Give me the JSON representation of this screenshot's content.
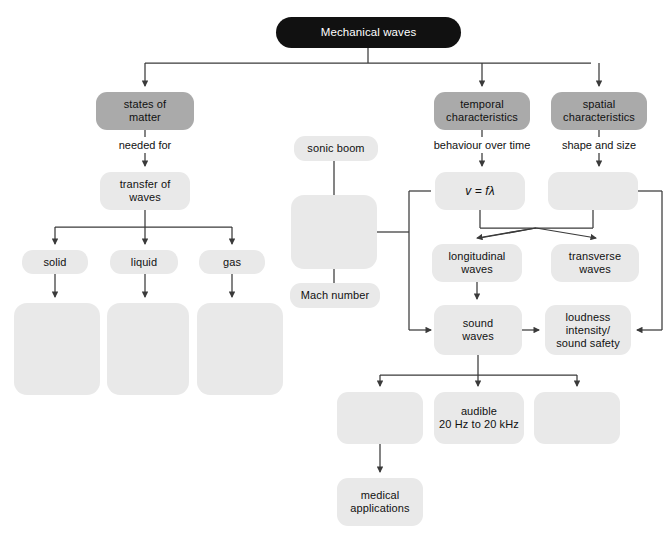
{
  "diagram": {
    "title": "Mechanical waves",
    "type": "concept-map",
    "colors": {
      "root_fill": "#111111",
      "root_text": "#ffffff",
      "level1_fill": "#aaaaaa",
      "node_fill": "#e9e9e9",
      "line": "#3a3a3a",
      "background": "#ffffff"
    },
    "nodes": [
      {
        "id": "root",
        "label": "Mechanical waves",
        "style": "root",
        "x": 276,
        "y": 17,
        "w": 185,
        "h": 31
      },
      {
        "id": "states",
        "label": "states of\nmatter",
        "style": "mid",
        "x": 96,
        "y": 92,
        "w": 98,
        "h": 38
      },
      {
        "id": "temporal",
        "label": "temporal\ncharacteristics",
        "style": "mid",
        "x": 434,
        "y": 92,
        "w": 96,
        "h": 38
      },
      {
        "id": "spatial",
        "label": "spatial\ncharacteristics",
        "style": "mid",
        "x": 551,
        "y": 92,
        "w": 96,
        "h": 38
      },
      {
        "id": "transfer",
        "label": "transfer of\nwaves",
        "style": "light",
        "x": 100,
        "y": 172,
        "w": 90,
        "h": 38
      },
      {
        "id": "solid",
        "label": "solid",
        "style": "light",
        "x": 22,
        "y": 250,
        "w": 66,
        "h": 24
      },
      {
        "id": "liquid",
        "label": "liquid",
        "style": "light",
        "x": 110,
        "y": 250,
        "w": 68,
        "h": 24
      },
      {
        "id": "gas",
        "label": "gas",
        "style": "light",
        "x": 199,
        "y": 250,
        "w": 66,
        "h": 24
      },
      {
        "id": "blank-solid",
        "label": "",
        "style": "blank",
        "x": 14,
        "y": 303,
        "w": 86,
        "h": 92
      },
      {
        "id": "blank-liquid",
        "label": "",
        "style": "blank",
        "x": 107,
        "y": 303,
        "w": 82,
        "h": 92
      },
      {
        "id": "blank-gas",
        "label": "",
        "style": "blank",
        "x": 197,
        "y": 303,
        "w": 86,
        "h": 92
      },
      {
        "id": "sonic-boom",
        "label": "sonic boom",
        "style": "light",
        "x": 294,
        "y": 136,
        "w": 84,
        "h": 25
      },
      {
        "id": "blank-speed",
        "label": "",
        "style": "blank",
        "x": 291,
        "y": 195,
        "w": 86,
        "h": 74
      },
      {
        "id": "mach",
        "label": "Mach number",
        "style": "light",
        "x": 290,
        "y": 283,
        "w": 90,
        "h": 25
      },
      {
        "id": "formula",
        "label": "v = fλ",
        "style": "light",
        "x": 435,
        "y": 172,
        "w": 90,
        "h": 38
      },
      {
        "id": "blank-spatial",
        "label": "",
        "style": "blank",
        "x": 548,
        "y": 172,
        "w": 90,
        "h": 38
      },
      {
        "id": "longitudinal",
        "label": "longitudinal\nwaves",
        "style": "light",
        "x": 432,
        "y": 244,
        "w": 90,
        "h": 38
      },
      {
        "id": "transverse",
        "label": "transverse\nwaves",
        "style": "light",
        "x": 551,
        "y": 244,
        "w": 88,
        "h": 38
      },
      {
        "id": "sound",
        "label": "sound\nwaves",
        "style": "light",
        "x": 434,
        "y": 305,
        "w": 88,
        "h": 50
      },
      {
        "id": "loudness",
        "label": "loudness\nintensity/\nsound safety",
        "style": "light",
        "x": 545,
        "y": 305,
        "w": 86,
        "h": 50
      },
      {
        "id": "blank-b1",
        "label": "",
        "style": "blank",
        "x": 337,
        "y": 392,
        "w": 86,
        "h": 52
      },
      {
        "id": "audible",
        "label": "audible\n20 Hz to 20 kHz",
        "style": "light",
        "x": 434,
        "y": 392,
        "w": 90,
        "h": 52
      },
      {
        "id": "blank-b3",
        "label": "",
        "style": "blank",
        "x": 534,
        "y": 392,
        "w": 86,
        "h": 52
      },
      {
        "id": "medical",
        "label": "medical\napplications",
        "style": "light",
        "x": 337,
        "y": 478,
        "w": 86,
        "h": 48
      }
    ],
    "edge_labels": [
      {
        "id": "needed-for",
        "text": "needed for",
        "x": 102,
        "y": 140,
        "w": 86
      },
      {
        "id": "behaviour-over-time",
        "text": "behaviour over time",
        "x": 422,
        "y": 140,
        "w": 120
      },
      {
        "id": "shape-and-size",
        "text": "shape and size",
        "x": 550,
        "y": 140,
        "w": 92
      }
    ]
  }
}
